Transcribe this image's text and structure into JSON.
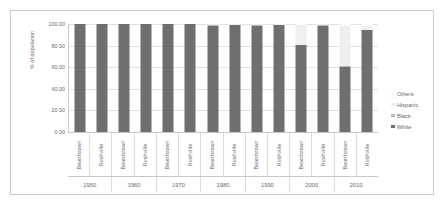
{
  "chart_data": {
    "type": "bar",
    "subtype": "stacked-column",
    "title": "",
    "xlabel": "",
    "ylabel": "% of population",
    "ylim": [
      0,
      100
    ],
    "yticks": [
      "0.00",
      "20.00",
      "40.00",
      "60.00",
      "80.00",
      "100.00"
    ],
    "ytick_values": [
      0,
      20,
      40,
      60,
      80,
      100
    ],
    "grid": true,
    "legend_position": "right",
    "legend": [
      "Others",
      "Hispanic",
      "Black",
      "White"
    ],
    "colors": {
      "White": "#6f6f6f",
      "Black": "#b9b9b9",
      "Hispanic": "#efefef",
      "Others": "#fbfbfb",
      "gridline": "#e2e2e2",
      "axis": "#c9c9c9",
      "text": "#6a6a6a"
    },
    "group_labels": [
      "1950",
      "1960",
      "1970",
      "1980",
      "1990",
      "2000",
      "2010"
    ],
    "categories": [
      "Beardstown",
      "Rushville",
      "Beardstown",
      "Rushville",
      "Beardstown",
      "Rushville",
      "Beardstown",
      "Rushville",
      "Beardstown",
      "Rushville",
      "Beardstown",
      "Rushville",
      "Beardstown",
      "Rushville"
    ],
    "series": [
      {
        "name": "White",
        "values": [
          100.0,
          100.0,
          100.0,
          100.0,
          100.0,
          100.0,
          98.5,
          99.3,
          98.4,
          99.3,
          80.2,
          98.6,
          60.5,
          94.0
        ]
      },
      {
        "name": "Black",
        "values": [
          0.0,
          0.0,
          0.0,
          0.0,
          0.0,
          0.0,
          0.6,
          0.2,
          0.5,
          0.2,
          0.7,
          0.3,
          1.0,
          0.5
        ]
      },
      {
        "name": "Hispanic",
        "values": [
          0.0,
          0.0,
          0.0,
          0.0,
          0.0,
          0.0,
          0.6,
          0.3,
          0.8,
          0.3,
          18.3,
          0.7,
          36.5,
          3.4
        ]
      },
      {
        "name": "Others",
        "values": [
          0.0,
          0.0,
          0.0,
          0.0,
          0.0,
          0.0,
          0.3,
          0.2,
          0.3,
          0.2,
          0.8,
          0.4,
          2.0,
          2.1
        ]
      }
    ]
  }
}
